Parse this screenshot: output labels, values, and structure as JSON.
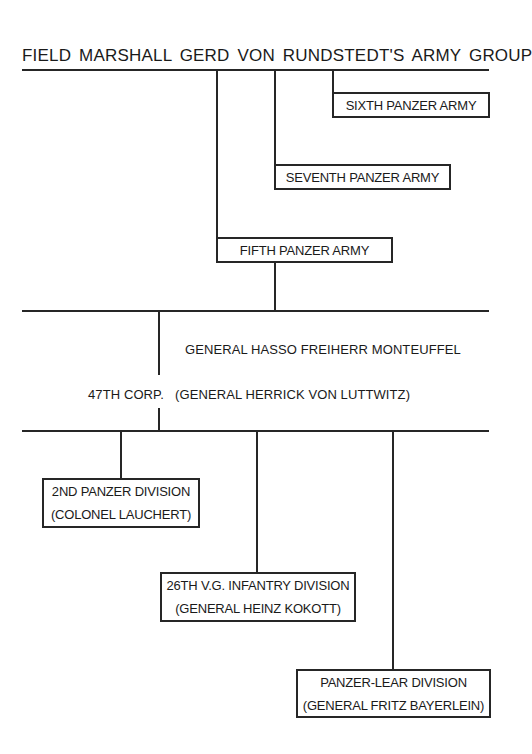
{
  "chart": {
    "title": "FIELD  MARSHALL  GERD VON RUNDSTEDT'S  ARMY  GROUP",
    "armies": [
      {
        "name": "SIXTH PANZER ARMY"
      },
      {
        "name": "SEVENTH PANZER ARMY"
      },
      {
        "name": "FIFTH PANZER ARMY"
      }
    ],
    "fifth_army_commander": "GENERAL  HASSO  FREIHERR  MONTEUFFEL",
    "corps": {
      "name": "47TH CORP.",
      "commander": "(GENERAL HERRICK VON LUTTWITZ)"
    },
    "divisions": [
      {
        "name": "2ND PANZER DIVISION",
        "commander": "(COLONEL LAUCHERT)"
      },
      {
        "name": "26TH V.G. INFANTRY DIVISION",
        "commander": "(GENERAL HEINZ KOKOTT)"
      },
      {
        "name": "PANZER-LEAR DIVISION",
        "commander": "(GENERAL FRITZ BAYERLEIN)"
      }
    ]
  }
}
